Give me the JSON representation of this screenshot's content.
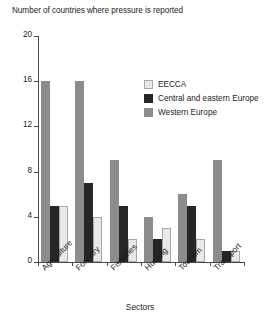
{
  "chart_data": {
    "type": "bar",
    "title": "Number of countries where pressure is reported",
    "xlabel": "Sectors",
    "ylabel": "",
    "ylim": [
      0,
      20
    ],
    "yticks": [
      0,
      4,
      8,
      12,
      16,
      20
    ],
    "grid": false,
    "legend_position": "inside-top-right",
    "categories": [
      "Agriculture",
      "Forestry",
      "Fisheries",
      "Hunting",
      "Tourism",
      "Transport"
    ],
    "series": [
      {
        "name": "Western Europe",
        "color": "#8c8c8c",
        "values": [
          16,
          16,
          9,
          4,
          6,
          9
        ]
      },
      {
        "name": "Central and eastern Europe",
        "color": "#262626",
        "values": [
          5,
          7,
          5,
          2,
          5,
          1
        ]
      },
      {
        "name": "EECCA",
        "color": "#e9e9e9",
        "values": [
          5,
          4,
          2,
          3,
          2,
          1
        ]
      }
    ],
    "legend_order": [
      "EECCA",
      "Central and eastern Europe",
      "Western Europe"
    ]
  },
  "legend": {
    "items": [
      {
        "label": "EECCA",
        "key": "eecca"
      },
      {
        "label": "Central and eastern Europe",
        "key": "cee"
      },
      {
        "label": "Western Europe",
        "key": "we"
      }
    ]
  }
}
